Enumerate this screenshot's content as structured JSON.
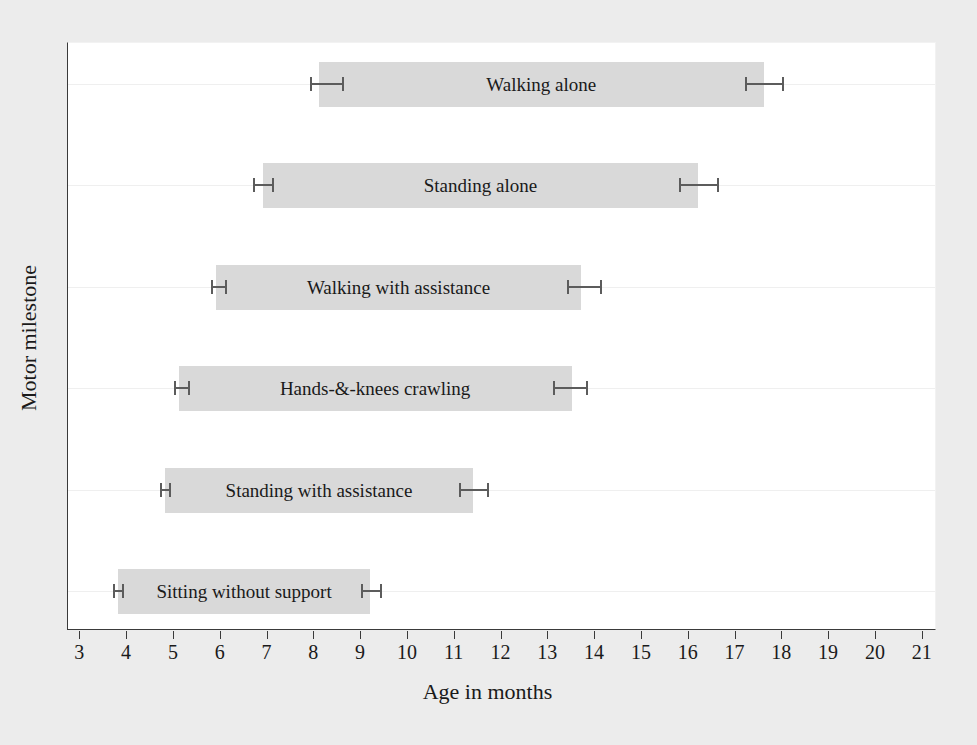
{
  "chart_data": {
    "type": "bar",
    "title": "",
    "xlabel": "Age in months",
    "ylabel": "Motor milestone",
    "xlim": [
      3,
      21
    ],
    "xticks": [
      3,
      4,
      5,
      6,
      7,
      8,
      9,
      10,
      11,
      12,
      13,
      14,
      15,
      16,
      17,
      18,
      19,
      20,
      21
    ],
    "grid": "horizontal",
    "legend": "none",
    "orientation": "horizontal",
    "note": "Floating (range) bars spanning the window of achievement for each gross motor milestone; whiskers show confidence limits at each end of the window.",
    "categories": [
      "Walking alone",
      "Standing alone",
      "Walking with assistance",
      "Hands-&-knees crawling",
      "Standing with assistance",
      "Sitting without support"
    ],
    "series": [
      {
        "name": "Window of achievement (months)",
        "bars": [
          {
            "category": "Walking alone",
            "start": 8.1,
            "end": 17.6,
            "start_ci_low": 7.9,
            "start_ci_high": 8.6,
            "end_ci_low": 17.2,
            "end_ci_high": 18.0
          },
          {
            "category": "Standing alone",
            "start": 6.9,
            "end": 16.2,
            "start_ci_low": 6.7,
            "start_ci_high": 7.1,
            "end_ci_low": 15.8,
            "end_ci_high": 16.6
          },
          {
            "category": "Walking with assistance",
            "start": 5.9,
            "end": 13.7,
            "start_ci_low": 5.8,
            "start_ci_high": 6.1,
            "end_ci_low": 13.4,
            "end_ci_high": 14.1
          },
          {
            "category": "Hands-&-knees crawling",
            "start": 5.1,
            "end": 13.5,
            "start_ci_low": 5.0,
            "start_ci_high": 5.3,
            "end_ci_low": 13.1,
            "end_ci_high": 13.8
          },
          {
            "category": "Standing with assistance",
            "start": 4.8,
            "end": 11.4,
            "start_ci_low": 4.7,
            "start_ci_high": 4.9,
            "end_ci_low": 11.1,
            "end_ci_high": 11.7
          },
          {
            "category": "Sitting without support",
            "start": 3.8,
            "end": 9.2,
            "start_ci_low": 3.7,
            "start_ci_high": 3.9,
            "end_ci_low": 9.0,
            "end_ci_high": 9.4
          }
        ]
      }
    ],
    "colors": {
      "bar_fill": "#d9d9d9",
      "error_bar": "#5c5c5c",
      "gridline": "#efefef",
      "axis": "#3a3a3a",
      "plot_background": "#ffffff",
      "figure_background": "#ececec",
      "text": "#1a1a1a"
    }
  }
}
